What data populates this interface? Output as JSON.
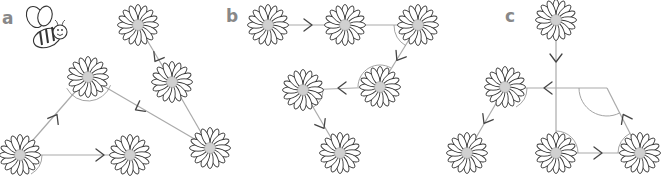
{
  "figure": {
    "colors": {
      "line": "#aaaaaa",
      "arrow": "#444444",
      "petal_stroke": "#333333",
      "center": "#d0d0d0",
      "label": "#888888"
    }
  },
  "panels": [
    {
      "label": "a",
      "label_pos": [
        0,
        34
      ],
      "flowers": [
        [
          138,
          25
        ],
        [
          172,
          82
        ],
        [
          88,
          77
        ],
        [
          210,
          148
        ],
        [
          20,
          155
        ],
        [
          130,
          155
        ]
      ],
      "edges": [
        [
          [
            138,
            25
          ],
          [
            172,
            82
          ]
        ],
        [
          [
            172,
            82
          ],
          [
            210,
            148
          ]
        ],
        [
          [
            210,
            148
          ],
          [
            88,
            77
          ]
        ],
        [
          [
            88,
            77
          ],
          [
            20,
            155
          ]
        ],
        [
          [
            20,
            155
          ],
          [
            130,
            155
          ]
        ]
      ],
      "arrows": [
        [
          157,
          58,
          120
        ],
        [
          139,
          108,
          152
        ],
        [
          55,
          118,
          300
        ],
        [
          100,
          155,
          0
        ]
      ],
      "angle_arcs": [
        [
          88,
          77,
          24,
          20,
          152
        ],
        [
          20,
          155,
          22,
          0,
          60
        ],
        [
          210,
          148,
          18,
          210,
          240
        ]
      ],
      "bee": true
    },
    {
      "label": "b",
      "label_pos": [
        224,
        22
      ],
      "flowers": [
        [
          268,
          25
        ],
        [
          345,
          25
        ],
        [
          418,
          25
        ],
        [
          380,
          87
        ],
        [
          303,
          90
        ],
        [
          340,
          153
        ]
      ],
      "edges": [
        [
          [
            268,
            25
          ],
          [
            345,
            25
          ]
        ],
        [
          [
            345,
            25
          ],
          [
            418,
            25
          ]
        ],
        [
          [
            418,
            25
          ],
          [
            380,
            87
          ]
        ],
        [
          [
            380,
            87
          ],
          [
            303,
            90
          ]
        ],
        [
          [
            303,
            90
          ],
          [
            340,
            153
          ]
        ]
      ],
      "arrows": [
        [
          308,
          25,
          0
        ],
        [
          399,
          57,
          122
        ],
        [
          342,
          88,
          180
        ],
        [
          322,
          125,
          60
        ]
      ],
      "angle_arcs": [
        [
          418,
          25,
          24,
          120,
          180
        ],
        [
          380,
          87,
          22,
          180,
          300
        ],
        [
          303,
          90,
          20,
          0,
          60
        ]
      ]
    },
    {
      "label": "c",
      "label_pos": [
        508,
        22
      ],
      "flowers": [
        [
          556,
          20
        ],
        [
          505,
          87
        ],
        [
          467,
          153
        ],
        [
          556,
          153
        ],
        [
          640,
          153
        ]
      ],
      "edges": [
        [
          [
            556,
            20
          ],
          [
            556,
            153
          ]
        ],
        [
          [
            556,
            88
          ],
          [
            505,
            88
          ]
        ],
        [
          [
            505,
            88
          ],
          [
            467,
            153
          ]
        ],
        [
          [
            556,
            88
          ],
          [
            607,
            88
          ]
        ],
        [
          [
            607,
            88
          ],
          [
            640,
            153
          ]
        ],
        [
          [
            556,
            153
          ],
          [
            640,
            153
          ]
        ]
      ],
      "arrows": [
        [
          556,
          58,
          90
        ],
        [
          548,
          88,
          180
        ],
        [
          486,
          120,
          120
        ],
        [
          598,
          153,
          0
        ],
        [
          625,
          118,
          -117
        ]
      ],
      "angle_arcs": [
        [
          505,
          88,
          22,
          0,
          60
        ],
        [
          607,
          88,
          28,
          63,
          180
        ],
        [
          556,
          153,
          22,
          270,
          360
        ],
        [
          640,
          153,
          22,
          180,
          243
        ]
      ]
    }
  ]
}
